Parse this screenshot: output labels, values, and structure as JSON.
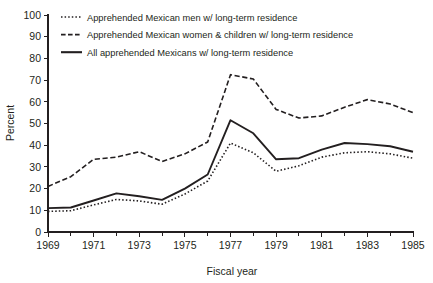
{
  "chart_data": {
    "type": "line",
    "title": "",
    "xlabel": "Fiscal year",
    "ylabel": "Percent",
    "xlim": [
      1969,
      1985
    ],
    "ylim": [
      0,
      100
    ],
    "grid": false,
    "legend_position": "top-left-inside",
    "x": [
      1969,
      1970,
      1971,
      1972,
      1973,
      1974,
      1975,
      1976,
      1977,
      1978,
      1979,
      1980,
      1981,
      1982,
      1983,
      1984,
      1985
    ],
    "xticks_major": [
      1969,
      1971,
      1973,
      1975,
      1977,
      1979,
      1981,
      1983,
      1985
    ],
    "xticks_minor": [
      1970,
      1972,
      1974,
      1976,
      1978,
      1980,
      1982,
      1984
    ],
    "yticks": [
      0,
      10,
      20,
      30,
      40,
      50,
      60,
      70,
      80,
      90,
      100
    ],
    "series": [
      {
        "name": "Apprehended Mexican men w/ long-term residence",
        "style": "dotted",
        "values": [
          9.5,
          9.8,
          12.5,
          15.0,
          14.3,
          12.8,
          17.5,
          23.5,
          41.0,
          36.5,
          28.0,
          30.5,
          34.5,
          36.5,
          37.0,
          36.0,
          34.0
        ]
      },
      {
        "name": "Apprehended Mexican women & children w/ long-term residence",
        "style": "dashed",
        "values": [
          21.0,
          25.5,
          33.5,
          34.5,
          37.0,
          32.5,
          36.0,
          41.5,
          72.5,
          70.5,
          56.5,
          52.5,
          53.5,
          57.5,
          61.0,
          59.0,
          55.0
        ]
      },
      {
        "name": "All apprehended Mexicans w/ long-term residence",
        "style": "solid",
        "values": [
          11.0,
          11.3,
          14.5,
          17.8,
          16.5,
          14.8,
          20.0,
          26.5,
          51.5,
          45.5,
          33.5,
          34.0,
          38.0,
          41.0,
          40.5,
          39.5,
          37.0
        ]
      }
    ]
  },
  "legend": {
    "items": [
      {
        "label": "Apprehended Mexican men w/ long-term residence",
        "style": "dotted"
      },
      {
        "label": "Apprehended Mexican women & children w/ long-term residence",
        "style": "dashed"
      },
      {
        "label": "All apprehended Mexicans w/ long-term residence",
        "style": "solid"
      }
    ]
  },
  "axis": {
    "y_title": "Percent",
    "x_title": "Fiscal year",
    "y_labels": [
      "100",
      "90",
      "80",
      "70",
      "60",
      "50",
      "40",
      "30",
      "20",
      "10",
      "0"
    ],
    "x_labels": [
      "1969",
      "1971",
      "1973",
      "1975",
      "1977",
      "1979",
      "1981",
      "1983",
      "1985"
    ]
  },
  "colors": {
    "ink": "#231f20",
    "background": "#ffffff"
  }
}
